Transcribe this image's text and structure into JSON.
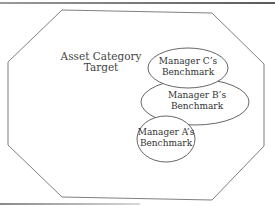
{
  "diagram": {
    "outer_shape": {
      "type": "octagon",
      "label_line1": "Asset Category",
      "label_line2": "Target"
    },
    "benchmarks": [
      {
        "id": "C",
        "line1": "Manager C’s",
        "line2": "Benchmark"
      },
      {
        "id": "B",
        "line1": "Manager B’s",
        "line2": "Benchmark"
      },
      {
        "id": "A",
        "line1": "Manager A’s",
        "line2": "Benchmark"
      }
    ],
    "colors": {
      "stroke": "#707070",
      "text": "#333333",
      "background": "#ffffff"
    }
  }
}
